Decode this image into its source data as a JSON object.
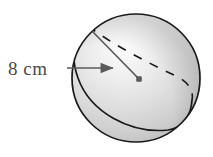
{
  "figure": {
    "name": "sphere-with-radius-label",
    "kind": "geometry-diagram",
    "background_color": "#ffffff"
  },
  "labels": {
    "radius_label": "8 cm",
    "radius_label_color": "#4a4a4a",
    "radius_value": 8,
    "radius_unit": "cm"
  },
  "sphere": {
    "center_x": 136,
    "center_y": 78,
    "radius": 64,
    "outline_color": "#1a1a1a",
    "outline_width": 1.6,
    "fill_light": "#f2f2f2",
    "fill_mid": "#d8d8d8",
    "fill_dark": "#b8b8b8"
  },
  "equator": {
    "solid_arc_color": "#1a1a1a",
    "dashed_arc_color": "#1a1a1a",
    "dash_pattern": "9 8",
    "stroke_width": 1.6
  },
  "radius_line": {
    "color": "#5a5a5a",
    "width": 1.6,
    "start_x": 93,
    "start_y": 32,
    "end_x": 139,
    "end_y": 79
  },
  "center_dot": {
    "x": 139,
    "y": 79,
    "size": 5,
    "color": "#5a5a5a"
  },
  "pointer_arrow": {
    "color": "#5a5a5a",
    "width": 1.4,
    "start_x": 68,
    "start_y": 68,
    "end_x": 116,
    "end_y": 68,
    "head_length": 9,
    "head_width": 7
  }
}
